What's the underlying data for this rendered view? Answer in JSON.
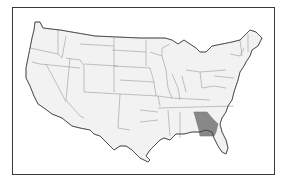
{
  "map": {
    "title": "",
    "region": "Contiguous United States",
    "highlighted_state": "Georgia",
    "colors": {
      "background": "#ffffff",
      "state_fill": "#f2f2f2",
      "state_border": "#9a9a9a",
      "highlight_fill": "#888888",
      "frame": "#3a3a3a"
    }
  }
}
